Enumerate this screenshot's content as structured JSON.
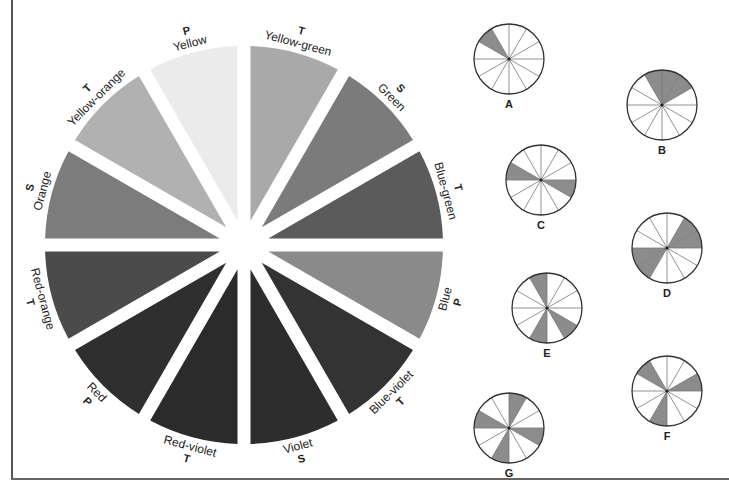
{
  "main_wheel": {
    "center": [
      244,
      245
    ],
    "radius": 199,
    "gap_width": 13,
    "segments": [
      {
        "name": "Yellow-green",
        "type": "T",
        "start_deg": 0,
        "end_deg": 30,
        "fill": "#a9a9a9"
      },
      {
        "name": "Green",
        "type": "S",
        "start_deg": 30,
        "end_deg": 60,
        "fill": "#7b7b7b"
      },
      {
        "name": "Blue-green",
        "type": "T",
        "start_deg": 60,
        "end_deg": 90,
        "fill": "#5b5b5b"
      },
      {
        "name": "Blue",
        "type": "P",
        "start_deg": 90,
        "end_deg": 120,
        "fill": "#8a8a8a"
      },
      {
        "name": "Blue-violet",
        "type": "T",
        "start_deg": 120,
        "end_deg": 150,
        "fill": "#333333"
      },
      {
        "name": "Violet",
        "type": "S",
        "start_deg": 150,
        "end_deg": 180,
        "fill": "#2d2d2d"
      },
      {
        "name": "Red-violet",
        "type": "T",
        "start_deg": 180,
        "end_deg": 210,
        "fill": "#2b2b2b"
      },
      {
        "name": "Red",
        "type": "P",
        "start_deg": 210,
        "end_deg": 240,
        "fill": "#2f2f2f"
      },
      {
        "name": "Red-orange",
        "type": "T",
        "start_deg": 240,
        "end_deg": 270,
        "fill": "#4b4b4b"
      },
      {
        "name": "Orange",
        "type": "S",
        "start_deg": 270,
        "end_deg": 300,
        "fill": "#7c7c7c"
      },
      {
        "name": "Yellow-orange",
        "type": "T",
        "start_deg": 300,
        "end_deg": 330,
        "fill": "#b1b1b1"
      },
      {
        "name": "Yellow",
        "type": "P",
        "start_deg": 330,
        "end_deg": 360,
        "fill": "#ebebeb"
      }
    ]
  },
  "mini_wheels": [
    {
      "label": "A",
      "center": [
        509,
        59
      ],
      "radius": 35,
      "shaded": [
        "Yellow-orange"
      ]
    },
    {
      "label": "B",
      "center": [
        662,
        105
      ],
      "radius": 35,
      "shaded": [
        "Yellow",
        "Yellow-green",
        "Green"
      ]
    },
    {
      "label": "C",
      "center": [
        541,
        180
      ],
      "radius": 35,
      "shaded": [
        "Orange",
        "Blue"
      ]
    },
    {
      "label": "D",
      "center": [
        667,
        248
      ],
      "radius": 35,
      "shaded": [
        "Green",
        "Blue-green",
        "Red",
        "Red-orange"
      ]
    },
    {
      "label": "E",
      "center": [
        547,
        308
      ],
      "radius": 35,
      "shaded": [
        "Yellow",
        "Blue-violet",
        "Red-violet"
      ]
    },
    {
      "label": "F",
      "center": [
        667,
        391
      ],
      "radius": 35,
      "shaded": [
        "Blue-green",
        "Red-violet",
        "Yellow-orange"
      ]
    },
    {
      "label": "G",
      "center": [
        509,
        428
      ],
      "radius": 35,
      "shaded": [
        "Yellow-green",
        "Blue",
        "Red-violet",
        "Orange"
      ]
    }
  ],
  "mini_style": {
    "shade_fill": "#8c8c8c",
    "line_color": "#777777",
    "rim_color": "#333333"
  }
}
